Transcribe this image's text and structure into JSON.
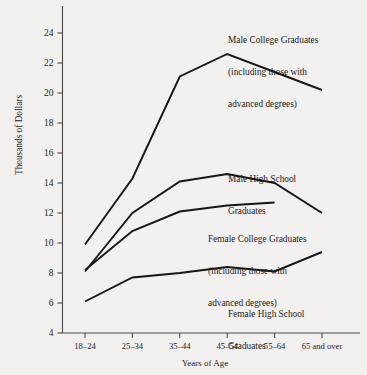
{
  "chart_data": {
    "type": "line",
    "title": "",
    "xlabel": "Years of Age",
    "ylabel": "Thousands of Dollars",
    "categories": [
      "18–24",
      "25–34",
      "35–44",
      "45–54",
      "55–64",
      "65 and over"
    ],
    "ylim": [
      4,
      24
    ],
    "yticks": [
      4,
      6,
      8,
      10,
      12,
      14,
      16,
      18,
      20,
      22,
      24
    ],
    "grid": false,
    "legend_position": "inline-annotations",
    "series": [
      {
        "name": "Male College Graduates (including those with advanced degrees)",
        "values": [
          9.9,
          14.3,
          21.1,
          22.6,
          21.4,
          20.2
        ]
      },
      {
        "name": "Male High School Graduates",
        "values": [
          8.1,
          12.0,
          14.1,
          14.6,
          14.0,
          12.0
        ]
      },
      {
        "name": "Female College Graduates (including those with advanced degrees)",
        "values": [
          8.2,
          10.8,
          12.1,
          12.5,
          12.7,
          null
        ]
      },
      {
        "name": "Female High School Graduates",
        "values": [
          6.1,
          7.7,
          8.0,
          8.4,
          8.1,
          9.4
        ]
      }
    ],
    "annotations": [
      {
        "id": "male-college",
        "lines": [
          "Male College Graduates",
          "(including those with",
          "advanced degrees)"
        ]
      },
      {
        "id": "male-hs",
        "lines": [
          "Male High School",
          "Graduates"
        ]
      },
      {
        "id": "female-college",
        "lines": [
          "Female College Graduates",
          "(including those with",
          "advanced degrees)"
        ]
      },
      {
        "id": "female-hs",
        "lines": [
          "Female High School",
          "Graduates"
        ]
      }
    ]
  },
  "axes": {
    "y_title": "Thousands of Dollars",
    "x_title": "Years of Age",
    "y_ticks": [
      "24",
      "22",
      "20",
      "18",
      "16",
      "14",
      "12",
      "10",
      "8",
      "6",
      "4"
    ],
    "x_ticks": [
      "18–24",
      "25–34",
      "35–44",
      "45–54",
      "55–64",
      "65 and over"
    ]
  },
  "annotations": {
    "male_college_l1": "Male College Graduates",
    "male_college_l2": "(including those with",
    "male_college_l3": "advanced degrees)",
    "male_hs_l1": "Male High School",
    "male_hs_l2": "Graduates",
    "female_college_l1": "Female College Graduates",
    "female_college_l2": "(including those with",
    "female_college_l3": "advanced degrees)",
    "female_hs_l1": "Female High School",
    "female_hs_l2": "Graduates"
  },
  "colors": {
    "background": "#f2f1ef",
    "line": "#161616",
    "axis": "#4a4a4a",
    "text": "#1b1b1b"
  }
}
